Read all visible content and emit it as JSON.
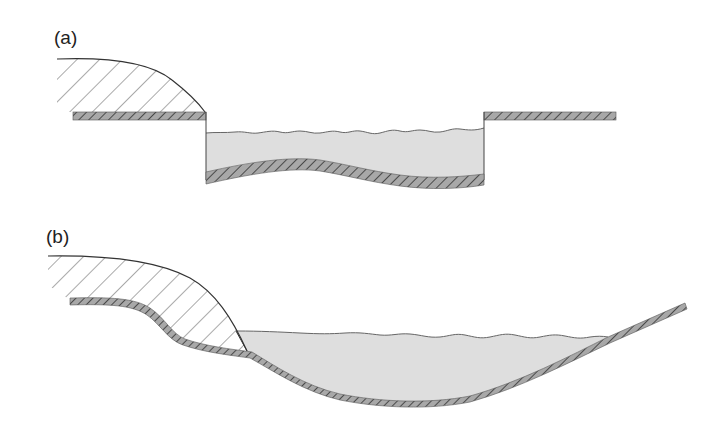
{
  "figure": {
    "panels": [
      {
        "id": "a",
        "label": "(a)",
        "description": "Landslide mass above a rectangular channel filled with water"
      },
      {
        "id": "b",
        "label": "(b)",
        "description": "Landslide mass on a sloping valley side entering a natural reservoir"
      }
    ],
    "colors": {
      "water_fill": "#dedede",
      "ground_fill": "#9a9a9a",
      "hatch_line": "#444444",
      "outline": "#333333",
      "background": "#ffffff"
    }
  }
}
